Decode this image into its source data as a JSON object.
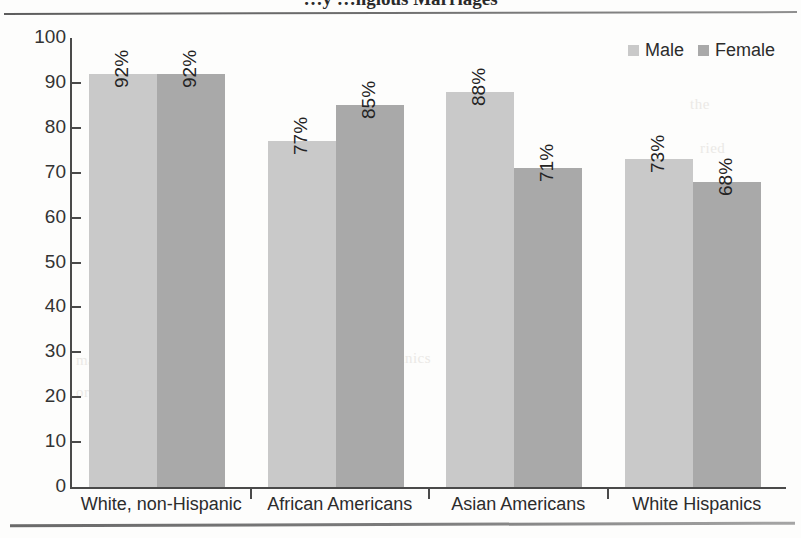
{
  "title": "…y …ligious Marriages",
  "legend": {
    "position": "top-right",
    "items": [
      {
        "label": "Male",
        "color": "#c9c9c9",
        "swatch_name": "legend-swatch-male"
      },
      {
        "label": "Female",
        "color": "#a9a9a9",
        "swatch_name": "legend-swatch-female"
      }
    ]
  },
  "bleed_text": [
    {
      "text": "the",
      "x": 690,
      "y": 96
    },
    {
      "text": "ried",
      "x": 700,
      "y": 140
    },
    {
      "text": "less",
      "x": 706,
      "y": 188
    },
    {
      "text": "American Hispanics",
      "x": 300,
      "y": 350
    },
    {
      "text": "nic",
      "x": 706,
      "y": 236
    },
    {
      "text": "were",
      "x": 700,
      "y": 284
    },
    {
      "text": "mar",
      "x": 76,
      "y": 352
    },
    {
      "text": "cent",
      "x": 712,
      "y": 332
    },
    {
      "text": "Hispanics",
      "x": 484,
      "y": 352
    },
    {
      "text": "and",
      "x": 702,
      "y": 380
    },
    {
      "text": "ority",
      "x": 76,
      "y": 384
    },
    {
      "text": "HR",
      "x": 700,
      "y": 430
    }
  ],
  "chart_data": {
    "type": "bar",
    "title": "…y …ligious Marriages",
    "xlabel": "",
    "ylabel": "",
    "ylim": [
      0,
      100
    ],
    "yticks": [
      0,
      10,
      20,
      30,
      40,
      50,
      60,
      70,
      80,
      90,
      100
    ],
    "grid": false,
    "legend_position": "top-right",
    "value_label_suffix": "%",
    "value_labels_rotated": true,
    "categories": [
      "White, non-Hispanic",
      "African Americans",
      "Asian Americans",
      "White Hispanics"
    ],
    "series": [
      {
        "name": "Male",
        "color": "#c9c9c9",
        "values": [
          92,
          77,
          88,
          73
        ],
        "labels": [
          "92%",
          "77%",
          "88%",
          "73%"
        ]
      },
      {
        "name": "Female",
        "color": "#a9a9a9",
        "values": [
          92,
          85,
          71,
          68
        ],
        "labels": [
          "92%",
          "85%",
          "71%",
          "68%"
        ]
      }
    ]
  }
}
